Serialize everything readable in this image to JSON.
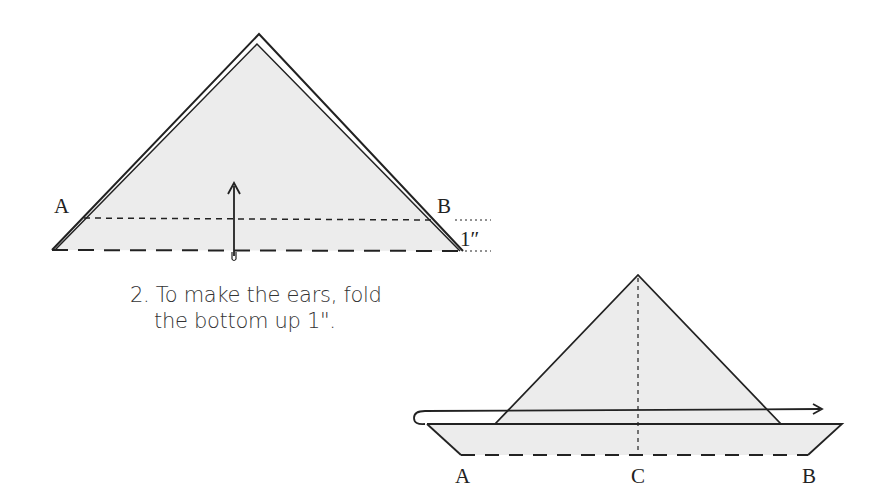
{
  "step1": {
    "label_a": "A",
    "label_b": "B",
    "measure": "1″",
    "fill_color": "#ececec",
    "line_color": "#222222"
  },
  "caption": {
    "line1": "2. To make the ears, fold",
    "line2": "the bottom up 1\"."
  },
  "step2": {
    "label_a": "A",
    "label_c": "C",
    "label_b": "B",
    "fill_color": "#ececec"
  }
}
